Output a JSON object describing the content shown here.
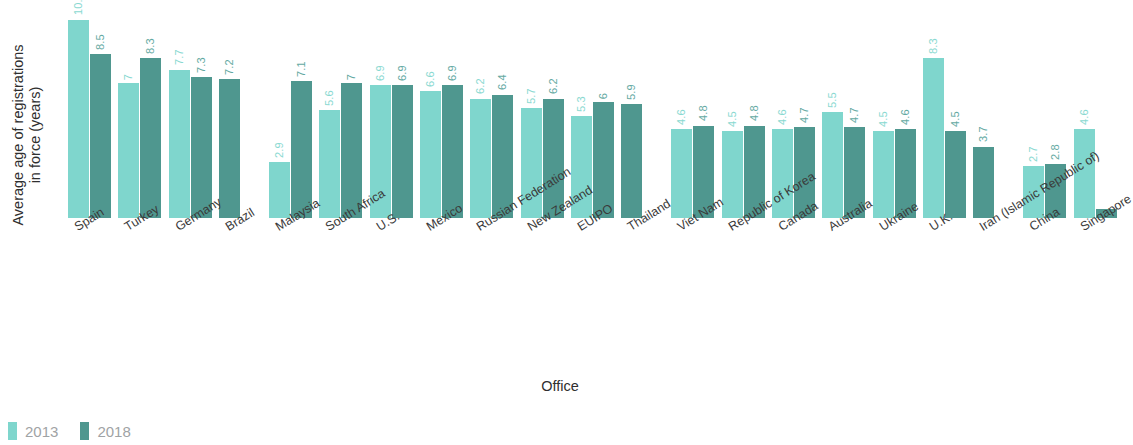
{
  "chart_data": {
    "type": "bar",
    "title": "",
    "xlabel": "Office",
    "ylabel": "Average age of registrations\nin force (years)",
    "ylim": [
      0,
      11
    ],
    "grid": false,
    "legend_position": "bottom-left",
    "categories": [
      "Spain",
      "Turkey",
      "Germany",
      "Brazil",
      "Malaysia",
      "South Africa",
      "U.S.",
      "Mexico",
      "Russian Federation",
      "New Zealand",
      "EUIPO",
      "Thailand",
      "Viet Nam",
      "Republic of Korea",
      "Canada",
      "Australia",
      "Ukraine",
      "U.K.",
      "Iran (Islamic Republic of)",
      "China",
      "Singapore"
    ],
    "series": [
      {
        "name": "2013",
        "color": "#7fd6cd",
        "values": [
          10.3,
          7,
          7.7,
          null,
          2.9,
          5.6,
          6.9,
          6.6,
          6.2,
          5.7,
          5.3,
          null,
          4.6,
          4.5,
          4.6,
          5.5,
          4.5,
          8.3,
          null,
          2.7,
          4.6
        ],
        "labels": [
          "10.3",
          "7",
          "7.7",
          "",
          "2.9",
          "5.6",
          "6.9",
          "6.6",
          "6.2",
          "5.7",
          "5.3",
          "",
          "4.6",
          "4.5",
          "4.6",
          "5.5",
          "4.5",
          "8.3",
          "",
          "2.7",
          "4.6"
        ]
      },
      {
        "name": "2018",
        "color": "#4f978f",
        "values": [
          8.5,
          8.3,
          7.3,
          7.2,
          7.1,
          7,
          6.9,
          6.9,
          6.4,
          6.2,
          6,
          5.9,
          4.8,
          4.8,
          4.7,
          4.7,
          4.6,
          4.5,
          3.7,
          2.8,
          0.45
        ],
        "labels": [
          "8.5",
          "8.3",
          "7.3",
          "7.2",
          "7.1",
          "7",
          "6.9",
          "6.9",
          "6.4",
          "6.2",
          "6",
          "5.9",
          "4.8",
          "4.8",
          "4.7",
          "4.7",
          "4.6",
          "4.5",
          "3.7",
          "2.8",
          ""
        ]
      }
    ]
  },
  "legend": {
    "items": [
      {
        "label": "2013",
        "color": "#7fd6cd"
      },
      {
        "label": "2018",
        "color": "#4f978f"
      }
    ]
  }
}
